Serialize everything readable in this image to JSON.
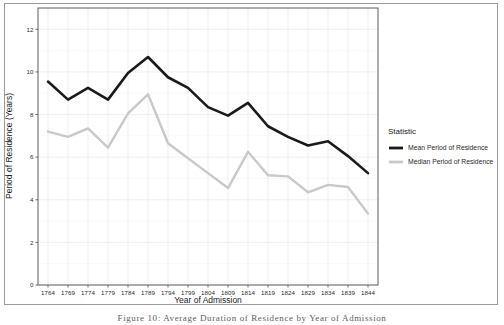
{
  "figure": {
    "caption": "Figure 10: Average Duration of Residence by Year of Admission",
    "legend_title": "Statistic"
  },
  "chart_data": {
    "type": "line",
    "title": "",
    "xlabel": "Year of Admission",
    "ylabel": "Period of Residence (Years)",
    "x": [
      1764,
      1769,
      1774,
      1779,
      1784,
      1789,
      1794,
      1799,
      1804,
      1809,
      1814,
      1819,
      1824,
      1829,
      1834,
      1839,
      1844
    ],
    "xtick_labels": [
      "1764",
      "1769",
      "1774",
      "1779",
      "1784",
      "1789",
      "1794",
      "1799",
      "1804",
      "1809",
      "1814",
      "1819",
      "1824",
      "1829",
      "1834",
      "1839",
      "1844"
    ],
    "ytick_labels": [
      "0",
      "2",
      "4",
      "6",
      "8",
      "10",
      "12"
    ],
    "yticks": [
      0,
      2,
      4,
      6,
      8,
      10,
      12
    ],
    "ylim": [
      0,
      13
    ],
    "xlim": [
      1761.5,
      1846.5
    ],
    "grid": true,
    "legend_position": "right",
    "series": [
      {
        "name": "Mean Period of Residence",
        "color": "#1a1a1a",
        "values": [
          9.55,
          8.7,
          9.25,
          8.7,
          9.95,
          10.7,
          9.75,
          9.25,
          8.35,
          7.95,
          8.55,
          7.45,
          6.95,
          6.55,
          6.75,
          6.05,
          5.25
        ]
      },
      {
        "name": "Median Period of Residence",
        "color": "#c9c9c9",
        "values": [
          7.2,
          6.95,
          7.35,
          6.45,
          8.05,
          8.95,
          6.65,
          5.95,
          5.25,
          4.55,
          6.25,
          5.15,
          5.1,
          4.35,
          4.7,
          4.6,
          3.35
        ]
      }
    ]
  }
}
